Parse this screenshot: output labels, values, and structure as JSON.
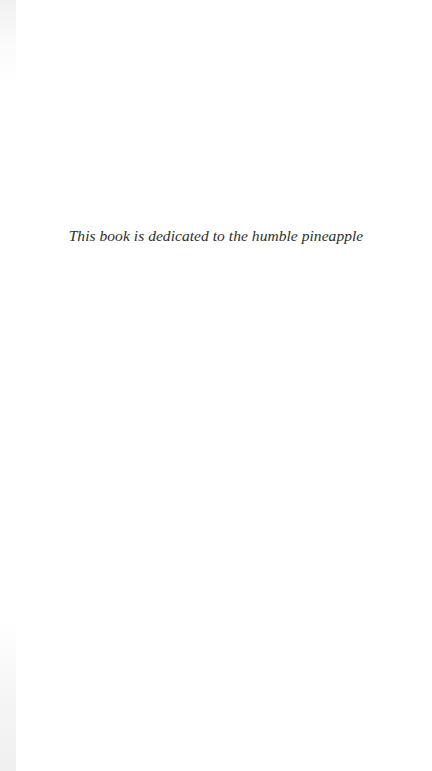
{
  "page": {
    "dedication_text": "This book is dedicated to the humble pineapple"
  },
  "colors": {
    "background": "#ffffff",
    "text": "#2e2e2e"
  }
}
